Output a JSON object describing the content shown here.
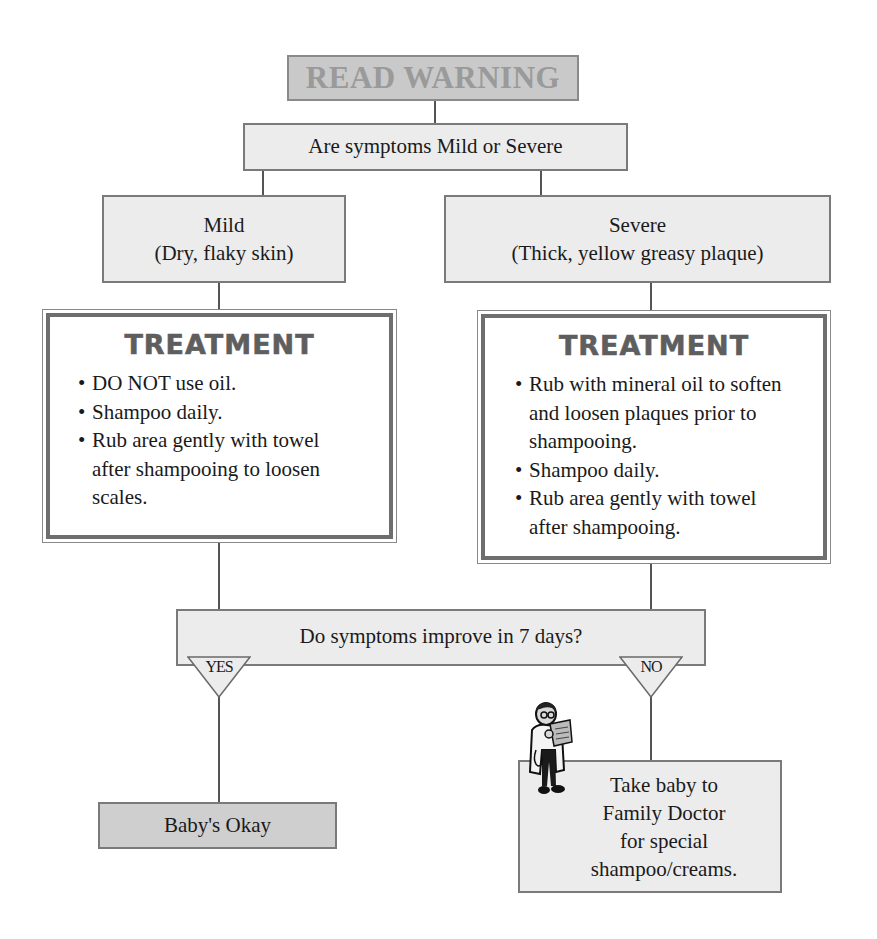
{
  "flowchart": {
    "title": "READ WARNING",
    "question_severity": "Are symptoms Mild or Severe",
    "mild": {
      "label": "Mild",
      "description": "(Dry, flaky skin)",
      "treatment": {
        "heading": "TREATMENT",
        "items": [
          "DO NOT use oil.",
          "Shampoo daily.",
          "Rub area gently with towel after shampooing to loosen scales."
        ]
      }
    },
    "severe": {
      "label": "Severe",
      "description": "(Thick, yellow greasy plaque)",
      "treatment": {
        "heading": "TREATMENT",
        "items": [
          "Rub with mineral oil to soften and loosen plaques prior to shampooing.",
          "Shampoo daily.",
          "Rub area gently with towel  after shampooing."
        ]
      }
    },
    "question_improve": "Do symptoms improve in 7 days?",
    "yes_label": "YES",
    "no_label": "NO",
    "yes_outcome": "Baby's Okay",
    "no_outcome": {
      "lines": [
        "Take baby to",
        "Family Doctor",
        "for special",
        "shampoo/creams."
      ]
    },
    "icons": {
      "doctor": "doctor-with-clipboard-icon"
    }
  }
}
